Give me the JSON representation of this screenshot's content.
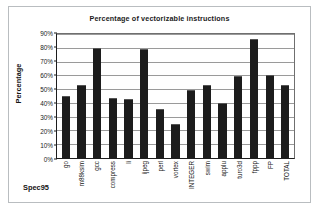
{
  "chart_data": {
    "type": "bar",
    "title": "Percentage of vectorizable instructions",
    "xlabel": "Spec95",
    "ylabel": "Percentage",
    "ylim": [
      0,
      90
    ],
    "grid": true,
    "legend": "none",
    "ytick_labels": [
      "90%",
      "80%",
      "70%",
      "60%",
      "50%",
      "40%",
      "30%",
      "20%",
      "10%",
      "0%"
    ],
    "ytick_values": [
      90,
      80,
      70,
      60,
      50,
      40,
      30,
      20,
      10,
      0
    ],
    "categories": [
      "go",
      "m88ksim",
      "gcc",
      "compress",
      "li",
      "ijpeg",
      "perl",
      "vortex",
      "INTEGER",
      "swim",
      "applu",
      "turo3d",
      "fppp",
      "FP",
      "TOTAL"
    ],
    "values": [
      44.5,
      52,
      79,
      42.5,
      42,
      78.5,
      35,
      24,
      48.5,
      52,
      39.5,
      59,
      86,
      59.5,
      52
    ],
    "bar_color": "#1c1c1c",
    "plot_background": "#ffffff",
    "gridline_color": "#9a9a9a",
    "axis_color": "#1d1d1d"
  },
  "frame": {
    "border_color": "#b9bdc0"
  }
}
